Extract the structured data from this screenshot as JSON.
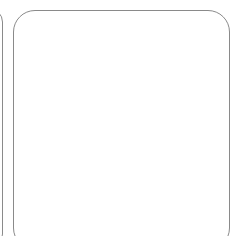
{
  "card": {
    "number_label": "46",
    "tens_rods": 4,
    "unit_cubes": 10,
    "rod_segments": 10,
    "unit_layout": {
      "columns": 2,
      "rows": 5
    }
  },
  "colors": {
    "stroke": "#2a2a2a",
    "card_border": "#8a8a8a",
    "text": "#1a1a1a"
  }
}
